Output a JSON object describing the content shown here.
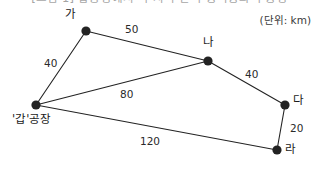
{
  "figure": {
    "title_partial": "[그림 1] 갑공장에서 각 지역 간 수송비용과 수송량",
    "unit_note": "(단위: km)",
    "background_color": "#ffffff",
    "ink_color": "#1a1a1a"
  },
  "chart_data": {
    "type": "diagram",
    "title": "[그림 1] 갑공장에서 각 지역 간 수송비용과 수송량",
    "unit": "km",
    "unit_label": "(단위: km)",
    "nodes": [
      {
        "id": "gap",
        "label": "'갑'공장",
        "x": 36,
        "y": 105,
        "label_dx": -24,
        "label_dy": 9
      },
      {
        "id": "ga",
        "label": "가",
        "x": 86,
        "y": 31,
        "label_dx": -21,
        "label_dy": -22
      },
      {
        "id": "na",
        "label": "나",
        "x": 208,
        "y": 61,
        "label_dx": -5,
        "label_dy": -24
      },
      {
        "id": "da",
        "label": "다",
        "x": 285,
        "y": 105,
        "label_dx": 8,
        "label_dy": -10
      },
      {
        "id": "ra",
        "label": "라",
        "x": 277,
        "y": 150,
        "label_dx": 8,
        "label_dy": -6
      }
    ],
    "edges": [
      {
        "from": "gap",
        "to": "ga",
        "value": 40,
        "label": "40",
        "lx": 44,
        "ly": 58
      },
      {
        "from": "ga",
        "to": "na",
        "value": 50,
        "label": "50",
        "lx": 125,
        "ly": 24
      },
      {
        "from": "gap",
        "to": "na",
        "value": 80,
        "label": "80",
        "lx": 120,
        "ly": 89
      },
      {
        "from": "na",
        "to": "da",
        "value": 40,
        "label": "40",
        "lx": 245,
        "ly": 69
      },
      {
        "from": "da",
        "to": "ra",
        "value": 20,
        "label": "20",
        "lx": 290,
        "ly": 123
      },
      {
        "from": "gap",
        "to": "ra",
        "value": 120,
        "label": "120",
        "lx": 140,
        "ly": 136
      }
    ],
    "node_radius": 4.6,
    "line_color": "#232323",
    "line_width": 1.1
  }
}
